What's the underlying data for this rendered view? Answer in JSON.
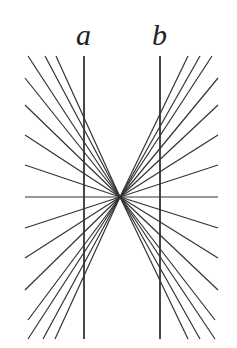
{
  "labels": {
    "a": "a",
    "b": "b"
  },
  "colors": {
    "line": "#333333",
    "background": "#ffffff"
  },
  "geometry": {
    "center": [
      120,
      197
    ],
    "vertical_a_x": 84,
    "vertical_b_x": 160,
    "vertical_top": 56,
    "vertical_bottom": 339,
    "left_ray_ends": [
      [
        28,
        56
      ],
      [
        45,
        56
      ],
      [
        56,
        56
      ],
      [
        25,
        78
      ],
      [
        25,
        105
      ],
      [
        25,
        135
      ],
      [
        25,
        165
      ],
      [
        25,
        197
      ],
      [
        25,
        228
      ],
      [
        25,
        258
      ],
      [
        25,
        290
      ],
      [
        28,
        320
      ],
      [
        43,
        339
      ],
      [
        55,
        339
      ],
      [
        28,
        339
      ]
    ],
    "right_ray_ends": [
      [
        212,
        56
      ],
      [
        200,
        56
      ],
      [
        188,
        56
      ],
      [
        218,
        78
      ],
      [
        218,
        105
      ],
      [
        218,
        135
      ],
      [
        218,
        165
      ],
      [
        218,
        197
      ],
      [
        218,
        228
      ],
      [
        218,
        258
      ],
      [
        218,
        290
      ],
      [
        215,
        320
      ],
      [
        200,
        339
      ],
      [
        188,
        339
      ],
      [
        215,
        339
      ]
    ]
  }
}
